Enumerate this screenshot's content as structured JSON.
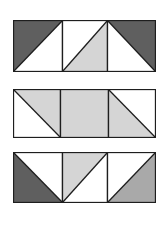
{
  "colors": {
    "dark": "#5f5f5f",
    "medium": "#a9a9a9",
    "light": "#d5d5d5",
    "blank": "#ffffff",
    "stroke": "#1e1e1e"
  },
  "rows": [
    {
      "name": "row-1",
      "x": 13,
      "y": 20,
      "w": 142,
      "h": 51,
      "dividers": [
        49,
        94
      ],
      "tiles": [
        {
          "fill": "dark",
          "triangle": [
            [
              0,
              0
            ],
            [
              1,
              0
            ],
            [
              0,
              1
            ]
          ],
          "diagonal": [
            [
              0,
              1
            ],
            [
              1,
              0
            ]
          ]
        },
        {
          "fill": "light",
          "triangle": [
            [
              1,
              0
            ],
            [
              1,
              1
            ],
            [
              0,
              1
            ]
          ],
          "diagonal": [
            [
              0,
              1
            ],
            [
              1,
              0
            ]
          ]
        },
        {
          "fill": "dark",
          "triangle": [
            [
              0,
              0
            ],
            [
              1,
              0
            ],
            [
              1,
              1
            ]
          ],
          "diagonal": [
            [
              0,
              0
            ],
            [
              1,
              1
            ]
          ]
        }
      ]
    },
    {
      "name": "row-2",
      "x": 13,
      "y": 89,
      "w": 142,
      "h": 48,
      "dividers": [
        47,
        95
      ],
      "tiles": [
        {
          "fill": "light",
          "triangle": [
            [
              0,
              0
            ],
            [
              1,
              0
            ],
            [
              1,
              1
            ]
          ],
          "diagonal": [
            [
              0,
              0
            ],
            [
              1,
              1
            ]
          ]
        },
        {
          "fill": "light",
          "triangle": [
            [
              0,
              0
            ],
            [
              1,
              0
            ],
            [
              1,
              1
            ],
            [
              0,
              1
            ]
          ],
          "diagonal": null
        },
        {
          "fill": "light",
          "triangle": [
            [
              0,
              0
            ],
            [
              1,
              1
            ],
            [
              0,
              1
            ]
          ],
          "diagonal": [
            [
              0,
              0
            ],
            [
              1,
              1
            ]
          ]
        }
      ]
    },
    {
      "name": "row-3",
      "x": 13,
      "y": 152,
      "w": 142,
      "h": 50,
      "dividers": [
        49,
        94
      ],
      "tiles": [
        {
          "fill": "dark",
          "triangle": [
            [
              0,
              0
            ],
            [
              1,
              1
            ],
            [
              0,
              1
            ]
          ],
          "diagonal": [
            [
              0,
              0
            ],
            [
              1,
              1
            ]
          ]
        },
        {
          "fill": "light",
          "triangle": [
            [
              0,
              0
            ],
            [
              1,
              0
            ],
            [
              0,
              1
            ]
          ],
          "diagonal": [
            [
              0,
              1
            ],
            [
              1,
              0
            ]
          ]
        },
        {
          "fill": "medium",
          "triangle": [
            [
              1,
              0
            ],
            [
              1,
              1
            ],
            [
              0,
              1
            ]
          ],
          "diagonal": [
            [
              0,
              1
            ],
            [
              1,
              0
            ]
          ]
        }
      ]
    }
  ]
}
